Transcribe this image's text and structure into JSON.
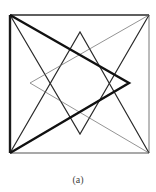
{
  "figure": {
    "caption": "(a)",
    "colors": {
      "stroke": "#1a1a1a",
      "thin_stroke": "#555555",
      "background": "#ffffff"
    },
    "square": {
      "x1": 10,
      "y1": 15,
      "x2": 149,
      "y2": 153
    },
    "points": {
      "top_left": [
        10,
        15
      ],
      "top_right": [
        149,
        15
      ],
      "bottom_left": [
        10,
        153
      ],
      "bottom_right": [
        149,
        153
      ],
      "thick_triangle_apex_right": [
        129,
        83
      ],
      "up_triangle_apex_top": [
        80,
        32
      ],
      "down_triangle_apex_bottom": [
        80,
        134
      ],
      "thin_triangle_apex_left": [
        30,
        83
      ]
    },
    "shapes": [
      {
        "name": "outer-square",
        "weight": "medium"
      },
      {
        "name": "thick-triangle-pointing-right",
        "weight": "thick"
      },
      {
        "name": "triangle-pointing-up",
        "weight": "medium"
      },
      {
        "name": "triangle-pointing-down",
        "weight": "medium"
      },
      {
        "name": "thin-triangle-pointing-left",
        "weight": "thin"
      }
    ]
  }
}
